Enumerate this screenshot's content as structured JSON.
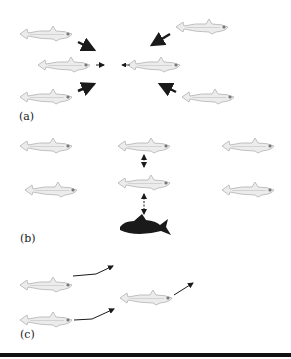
{
  "panels": [
    {
      "label": "(a)",
      "description": "attraction"
    },
    {
      "label": "(b)",
      "description": "repulsion / predator"
    },
    {
      "label": "(c)",
      "description": "alignment"
    }
  ],
  "colors": {
    "fish_light": "#e6e6e6",
    "fish_outline": "#b5b5b5",
    "fish_dark": "#1a1a1a",
    "arrow": "#1a1a1a"
  }
}
